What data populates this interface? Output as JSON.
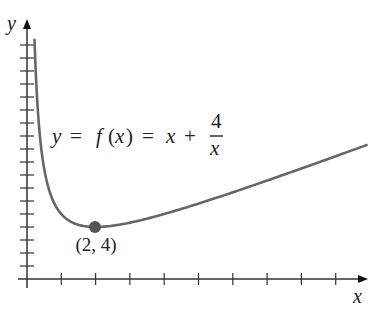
{
  "chart_data": {
    "type": "line",
    "title": "",
    "xlabel": "x",
    "ylabel": "y",
    "function": "f(x) = x + 4/x",
    "annotation": {
      "equation_parts": {
        "lhs": "y",
        "eq1": "=",
        "f": "f",
        "paren_open": "(",
        "arg": "x",
        "paren_close": ")",
        "eq2": "=",
        "term": "x",
        "plus": "+",
        "numerator": "4",
        "denominator": "x"
      },
      "point_label": "(2, 4)"
    },
    "highlight_point": {
      "x": 2,
      "y": 4,
      "label": "(2, 4)"
    },
    "x_ticks": [
      1,
      2,
      3,
      4,
      5,
      6,
      7,
      8,
      9
    ],
    "y_ticks": [
      1,
      2,
      3,
      4,
      5,
      6,
      7,
      8,
      9,
      10,
      11,
      12,
      13,
      14,
      15,
      16,
      17,
      18
    ],
    "xlim": [
      0,
      10
    ],
    "ylim": [
      0,
      19
    ],
    "grid": false,
    "legend": null,
    "series": [
      {
        "name": "f(x) = x + 4/x",
        "x": [
          0.22,
          0.3,
          0.4,
          0.5,
          0.75,
          1,
          1.25,
          1.5,
          2,
          2.5,
          3,
          4,
          5,
          6,
          7,
          8,
          9,
          9.9
        ],
        "y": [
          18.4,
          13.63,
          10.4,
          8.5,
          6.08,
          5,
          4.45,
          4.17,
          4,
          4.1,
          4.33,
          5,
          5.8,
          6.67,
          7.57,
          8.5,
          9.44,
          10.3
        ]
      }
    ],
    "colors": {
      "curve": "#666666",
      "point": "#555555",
      "axes": "#333333",
      "text": "#222222"
    }
  }
}
